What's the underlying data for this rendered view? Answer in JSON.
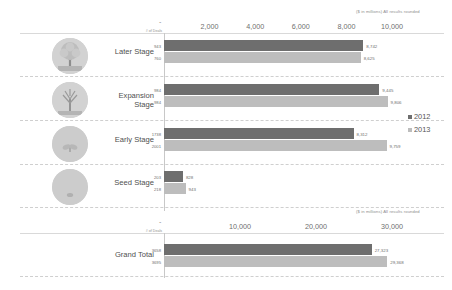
{
  "annotation": "($ in millions) All results rounded",
  "deals_caption": "# of Deals",
  "zero_tick": "-",
  "legend": [
    {
      "label": "2012",
      "color": "#6e6e6e"
    },
    {
      "label": "2013",
      "color": "#bdbdbd"
    }
  ],
  "top_axis": {
    "ticks": [
      "2,000",
      "4,000",
      "6,000",
      "8,000",
      "10,000"
    ],
    "max": 10000
  },
  "bottom_axis": {
    "ticks": [
      "10,000",
      "20,000",
      "30,000"
    ],
    "max": 30000
  },
  "chart_data": {
    "type": "bar",
    "title": "",
    "subtitle": "($ in millions) All results rounded",
    "orientation": "horizontal",
    "grouped": true,
    "xlabel": "",
    "ylabel": "",
    "grid": false,
    "legend_position": "right",
    "categories": [
      "Later Stage",
      "Expansion Stage",
      "Early Stage",
      "Seed Stage"
    ],
    "series": [
      {
        "name": "2012",
        "color": "#6e6e6e",
        "values": [
          8742,
          9445,
          8312,
          828
        ]
      },
      {
        "name": "2013",
        "color": "#bdbdbd",
        "values": [
          8625,
          9806,
          9759,
          943
        ]
      }
    ],
    "deal_counts": {
      "2012": [
        943,
        984,
        1738,
        203
      ],
      "2013": [
        760,
        984,
        2001,
        218
      ]
    },
    "xlim": [
      0,
      10000
    ],
    "xticks": [
      2000,
      4000,
      6000,
      8000,
      10000
    ],
    "total": {
      "category": "Grand Total",
      "series": [
        {
          "name": "2012",
          "color": "#6e6e6e",
          "value": 27323,
          "deals": 3658
        },
        {
          "name": "2013",
          "color": "#bdbdbd",
          "value": 29368,
          "deals": 3695
        }
      ],
      "xlim": [
        0,
        30000
      ],
      "xticks": [
        10000,
        20000,
        30000
      ]
    }
  },
  "rows": [
    {
      "label": "Later Stage",
      "icon": "mature-tree-icon",
      "bars": [
        {
          "year": "2012",
          "deals": "943",
          "value_label": "8,742",
          "value": 8742
        },
        {
          "year": "2013",
          "deals": "760",
          "value_label": "8,625",
          "value": 8625
        }
      ]
    },
    {
      "label": "Expansion\nStage",
      "icon": "growing-tree-icon",
      "bars": [
        {
          "year": "2012",
          "deals": "984",
          "value_label": "9,445",
          "value": 9445
        },
        {
          "year": "2013",
          "deals": "984",
          "value_label": "9,806",
          "value": 9806
        }
      ]
    },
    {
      "label": "Early Stage",
      "icon": "sprout-icon",
      "bars": [
        {
          "year": "2012",
          "deals": "1738",
          "value_label": "8,312",
          "value": 8312
        },
        {
          "year": "2013",
          "deals": "2001",
          "value_label": "9,759",
          "value": 9759
        }
      ]
    },
    {
      "label": "Seed Stage",
      "icon": "seed-icon",
      "bars": [
        {
          "year": "2012",
          "deals": "203",
          "value_label": "828",
          "value": 828
        },
        {
          "year": "2013",
          "deals": "218",
          "value_label": "943",
          "value": 943
        }
      ]
    }
  ],
  "total_row": {
    "label": "Grand Total",
    "bars": [
      {
        "year": "2012",
        "deals": "3658",
        "value_label": "27,323",
        "value": 27323
      },
      {
        "year": "2013",
        "deals": "3695",
        "value_label": "29,368",
        "value": 29368
      }
    ]
  }
}
